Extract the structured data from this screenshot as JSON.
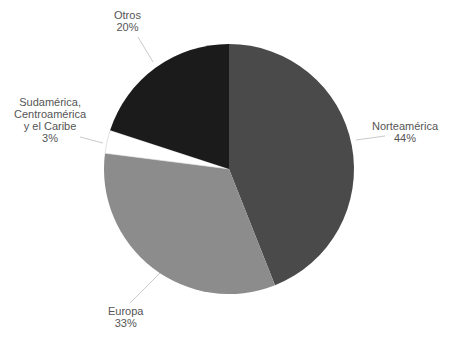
{
  "chart_data": {
    "type": "pie",
    "title": "",
    "categories": [
      "Norteamérica",
      "Europa",
      "Sudamérica, Centroamérica y el Caribe",
      "Otros"
    ],
    "values": [
      44,
      33,
      3,
      20
    ],
    "unit": "%",
    "colors": [
      "#4a4a4a",
      "#8c8c8c",
      "#ffffff",
      "#1b1b1b"
    ],
    "start_angle_deg": 0,
    "direction": "clockwise from 12 o'clock",
    "legend": "none (direct labels with leader lines)"
  },
  "labels": {
    "norteamerica": {
      "name": "Norteamérica",
      "pct": "44%"
    },
    "europa": {
      "name": "Europa",
      "pct": "33%"
    },
    "sudamerica": {
      "line1": "Sudamérica,",
      "line2": "Centroamérica",
      "line3": "y el Caribe",
      "pct": "3%"
    },
    "otros": {
      "name": "Otros",
      "pct": "20%"
    }
  }
}
